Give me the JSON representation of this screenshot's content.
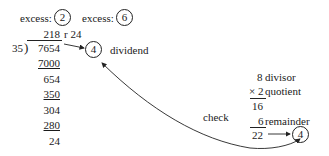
{
  "excess": {
    "label_1": "excess:",
    "value_1": "2",
    "label_2": "excess:",
    "value_2": "6"
  },
  "long_division": {
    "quotient": "218",
    "remainder_label": "r 24",
    "divisor": "35",
    "dividend": "7654",
    "steps": [
      "7000",
      "654",
      "350",
      "304",
      "280",
      "24"
    ]
  },
  "dividend_check": {
    "value": "4",
    "label": "dividend"
  },
  "check_label": "check",
  "verification": {
    "divisor_value": "8",
    "divisor_label": "divisor",
    "times_sign": "×",
    "quotient_value": "2",
    "quotient_label": "quotient",
    "product": "16",
    "remainder_value": "6",
    "remainder_label": "remainder",
    "sum": "22",
    "result": "4"
  }
}
